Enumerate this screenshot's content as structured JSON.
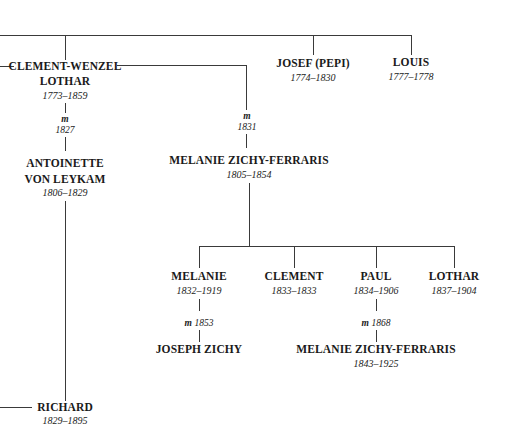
{
  "people": {
    "clement_wenzel": {
      "name_line1": "CLEMENT-WENZEL",
      "name_line2": "LOTHAR",
      "dates": "1773–1859"
    },
    "josef": {
      "name": "JOSEF (PEPI)",
      "dates": "1774–1830"
    },
    "louis": {
      "name": "LOUIS",
      "dates": "1777–1778"
    },
    "antoinette": {
      "name_line1": "ANTOINETTE",
      "name_line2": "VON LEYKAM",
      "dates": "1806–1829"
    },
    "melanie_zf": {
      "name": "MELANIE ZICHY-FERRARIS",
      "dates": "1805–1854"
    },
    "melanie_child": {
      "name": "MELANIE",
      "dates": "1832–1919"
    },
    "clement_child": {
      "name": "CLEMENT",
      "dates": "1833–1833"
    },
    "paul": {
      "name": "PAUL",
      "dates": "1834–1906"
    },
    "lothar": {
      "name": "LOTHAR",
      "dates": "1837–1904"
    },
    "joseph_zichy": {
      "name": "JOSEPH ZICHY"
    },
    "melanie_zf2": {
      "name": "MELANIE ZICHY-FERRARIS",
      "dates": "1843–1925"
    },
    "richard": {
      "name": "RICHARD",
      "dates": "1829–1895"
    }
  },
  "marriages": {
    "m1": {
      "label": "m",
      "year": "1827"
    },
    "m2": {
      "label": "m",
      "year": "1831"
    },
    "m3": {
      "label": "m",
      "year": "1853"
    },
    "m4": {
      "label": "m",
      "year": "1868"
    }
  }
}
